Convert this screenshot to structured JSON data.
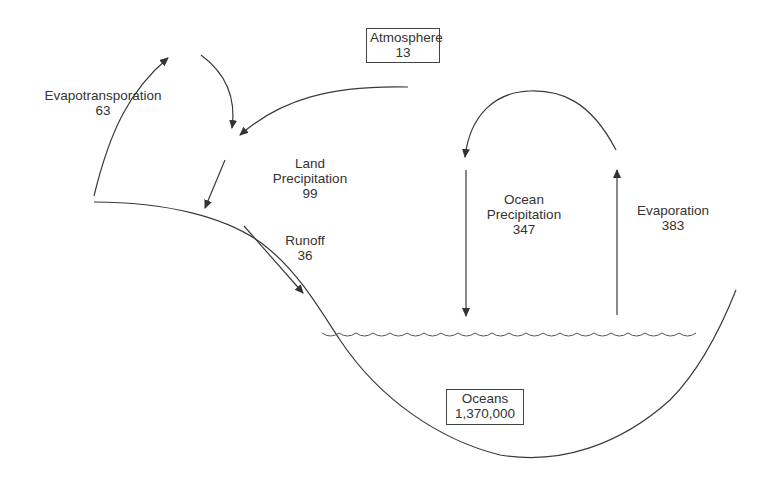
{
  "reservoirs": {
    "atmosphere": {
      "label": "Atmosphere",
      "value": "13"
    },
    "oceans": {
      "label": "Oceans",
      "value": "1,370,000"
    }
  },
  "fluxes": {
    "evapotranspiration": {
      "label": "Evapotransporation",
      "value": "63"
    },
    "land_precipitation": {
      "label_line1": "Land",
      "label_line2": "Precipitation",
      "value": "99"
    },
    "runoff": {
      "label": "Runoff",
      "value": "36"
    },
    "ocean_precipitation": {
      "label_line1": "Ocean",
      "label_line2": "Precipitation",
      "value": "347"
    },
    "evaporation": {
      "label": "Evaporation",
      "value": "383"
    }
  },
  "colors": {
    "line": "#3a3a3a",
    "background": "#ffffff",
    "text": "#333333"
  }
}
